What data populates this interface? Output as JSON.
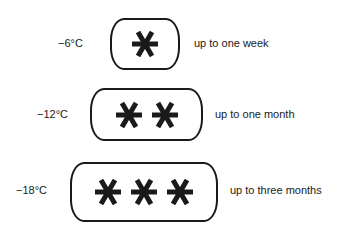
{
  "rows": [
    {
      "temperature": "−6°C",
      "stars": 1,
      "duration": "up to one week"
    },
    {
      "temperature": "−12°C",
      "stars": 2,
      "duration": "up to one month"
    },
    {
      "temperature": "−18°C",
      "stars": 3,
      "duration": "up to three months"
    }
  ],
  "icons": {
    "star": "freezer-star-icon"
  },
  "colors": {
    "ink": "#1a1a1a",
    "background": "#ffffff"
  }
}
